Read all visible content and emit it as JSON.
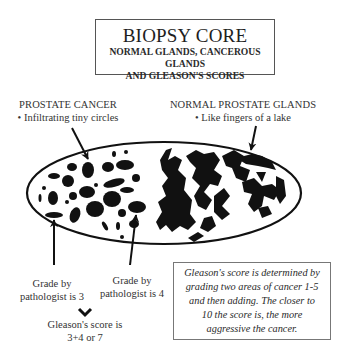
{
  "title": {
    "main": "BIOPSY CORE",
    "sub_line1": "NORMAL GLANDS, CANCEROUS GLANDS",
    "sub_line2": "AND GLEASON'S SCORES"
  },
  "labels": {
    "cancer": {
      "heading": "PROSTATE CANCER",
      "bullet": "• Infiltrating tiny circles"
    },
    "normal": {
      "heading": "NORMAL PROSTATE GLANDS",
      "bullet": "• Like fingers of a lake"
    },
    "grade3": {
      "line1": "Grade by",
      "line2": "pathologist is 3"
    },
    "grade4": {
      "line1": "Grade by",
      "line2": "pathologist is 4"
    },
    "score": {
      "line1": "Gleason's score is",
      "line2": "3+4 or 7"
    }
  },
  "info_box": {
    "line1": "Gleason's score is determined by",
    "line2": "grading two areas of cancer 1-5",
    "line3": "and then adding. The closer to",
    "line4": "10 the score is, the more",
    "line5": "aggressive the cancer."
  },
  "icons": {
    "chevron": "chevron-down-icon"
  },
  "colors": {
    "ink": "#111111",
    "text": "#2a2a2a",
    "border": "#555555"
  }
}
